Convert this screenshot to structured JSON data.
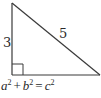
{
  "diagram": {
    "type": "right-triangle",
    "vertices": {
      "top": [
        12,
        3
      ],
      "bottom_left": [
        12,
        75
      ],
      "bottom_right": [
        100,
        75
      ]
    },
    "right_angle_marker": {
      "corner": "bottom-left",
      "size": 11
    },
    "stroke_color": "#3a3a3a",
    "labels": {
      "vertical_leg": "3",
      "hypotenuse": "5"
    }
  },
  "equation": {
    "a": "a",
    "a_exp": "2",
    "plus": "+",
    "b": "b",
    "b_exp": "2",
    "equals": "=",
    "c": "c",
    "c_exp": "2"
  }
}
